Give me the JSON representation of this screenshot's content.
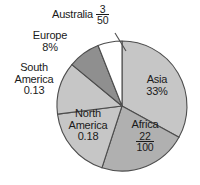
{
  "chart_data": {
    "type": "pie",
    "title": "",
    "legend_position": "callout-labels",
    "grid": false,
    "categories": [
      "Asia",
      "Africa",
      "North America",
      "South America",
      "Europe",
      "Australia"
    ],
    "values": [
      33,
      22,
      18,
      13,
      8,
      6
    ],
    "value_labels": [
      "33%",
      "22/100",
      "0.18",
      "0.13",
      "8%",
      "3/50"
    ],
    "slices": [
      {
        "name": "Asia",
        "label": "Asia",
        "value_text": "33%",
        "value": 33,
        "notation": "percent",
        "color": "#c6c6c6",
        "start_angle": 0,
        "end_angle": 118.8
      },
      {
        "name": "Africa",
        "label": "Africa",
        "value_text": "22/100",
        "numerator": "22",
        "denominator": "100",
        "value": 22,
        "notation": "fraction",
        "color": "#b0b0b0",
        "start_angle": 118.8,
        "end_angle": 198.0
      },
      {
        "name": "North America",
        "label_line1": "North",
        "label_line2": "America",
        "value_text": "0.18",
        "value": 18,
        "notation": "decimal",
        "color": "#c6c6c6",
        "start_angle": 198.0,
        "end_angle": 262.8
      },
      {
        "name": "South America",
        "label_line1": "South",
        "label_line2": "America",
        "value_text": "0.13",
        "value": 13,
        "notation": "decimal",
        "color": "#c6c6c6",
        "start_angle": 262.8,
        "end_angle": 309.6
      },
      {
        "name": "Europe",
        "label": "Europe",
        "value_text": "8%",
        "value": 8,
        "notation": "percent",
        "color": "#8f8f8f",
        "start_angle": 309.6,
        "end_angle": 338.4
      },
      {
        "name": "Australia",
        "label": "Australia",
        "value_text": "3/50",
        "numerator": "3",
        "denominator": "50",
        "value": 6,
        "notation": "fraction",
        "color": "#ffffff",
        "start_angle": 338.4,
        "end_angle": 360
      }
    ]
  },
  "labels": {
    "australia": "Australia",
    "australia_num": "3",
    "australia_den": "50",
    "europe": "Europe",
    "europe_value": "8%",
    "south_america_1": "South",
    "south_america_2": "America",
    "south_america_value": "0.13",
    "north_america_1": "North",
    "north_america_2": "America",
    "north_america_value": "0.18",
    "africa": "Africa",
    "africa_num": "22",
    "africa_den": "100",
    "asia": "Asia",
    "asia_value": "33%"
  },
  "colors": {
    "outline": "#4d4d4d",
    "light_gray": "#c6c6c6",
    "medium_gray": "#b0b0b0",
    "dark_gray": "#8f8f8f",
    "white_slice": "#ffffff",
    "text": "#1a1a1a",
    "background": "#ffffff"
  }
}
